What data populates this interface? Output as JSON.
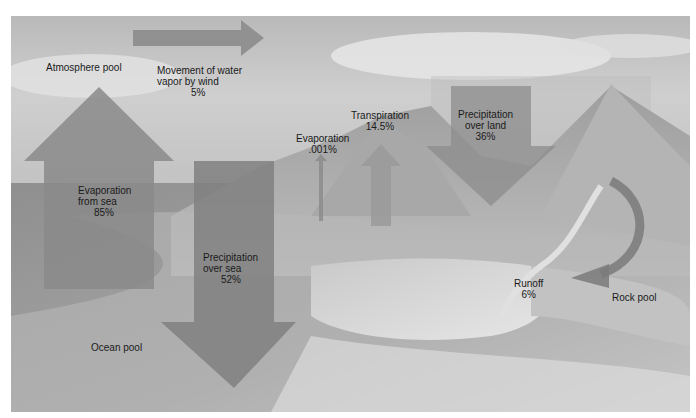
{
  "diagram": {
    "pools": {
      "atmosphere": "Atmosphere pool",
      "ocean": "Ocean pool",
      "rock": "Rock pool"
    },
    "flows": {
      "wind": {
        "line1": "Movement of water",
        "line2": "vapor by wind",
        "value": "5%"
      },
      "evap_sea": {
        "line1": "Evaporation",
        "line2": "from sea",
        "value": "85%"
      },
      "precip_sea": {
        "line1": "Precipitation",
        "line2": "over sea",
        "value": "52%"
      },
      "evap_land": {
        "line1": "Evaporation",
        "value": ".001%"
      },
      "transpiration": {
        "line1": "Transpiration",
        "value": "14.5%"
      },
      "precip_land": {
        "line1": "Precipitation",
        "line2": "over land",
        "value": "36%"
      },
      "runoff": {
        "line1": "Runoff",
        "value": "6%"
      }
    },
    "colors": {
      "arrow": "#8a8a8a",
      "arrow_dark": "#707070",
      "ocean": "#9a9a9a",
      "sky": "#c8c8c8",
      "land": "#b0b0b0"
    }
  }
}
